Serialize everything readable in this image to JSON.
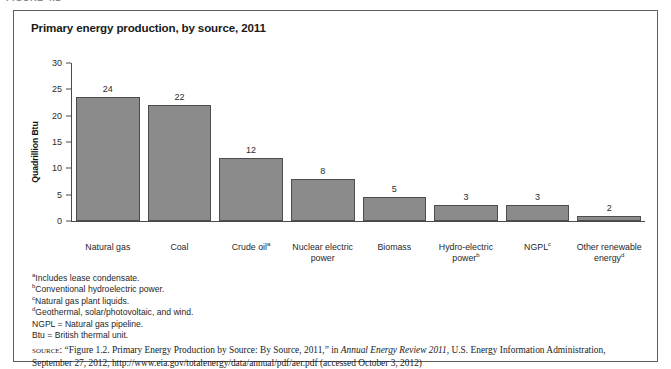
{
  "figure_caption": "FIGURE 4.2",
  "figure": {
    "title": "Primary energy production, by source, 2011"
  },
  "chart_data": {
    "type": "bar",
    "title": "Primary energy production, by source, 2011",
    "xlabel": "",
    "ylabel": "Quadrillion Btu",
    "ylim": [
      0,
      30
    ],
    "yticks": [
      0,
      5,
      10,
      15,
      20,
      25,
      30
    ],
    "grid": false,
    "legend": null,
    "categories": [
      "Natural gas",
      "Coal",
      "Crude oilᵃ",
      "Nuclear electric power",
      "Biomass",
      "Hydro-electric powerᵇ",
      "NGPLᶜ",
      "Other renewable energyᵈ"
    ],
    "values": [
      24,
      22,
      12,
      8,
      5,
      3,
      3,
      2
    ],
    "bar_color": "#8b8b8b",
    "bar_edge_color": "#4d4d4d",
    "data_labels": [
      "24",
      "22",
      "12",
      "8",
      "5",
      "3",
      "3",
      "2"
    ],
    "bar_pixel_heights": [
      23.5,
      22,
      12,
      8,
      4.5,
      3,
      3,
      0.9
    ]
  },
  "x_labels": [
    {
      "line1": "Natural gas",
      "line2": "",
      "sup": ""
    },
    {
      "line1": "Coal",
      "line2": "",
      "sup": ""
    },
    {
      "line1": "Crude oil",
      "line2": "",
      "sup": "a"
    },
    {
      "line1": "Nuclear electric",
      "line2": "power",
      "sup": ""
    },
    {
      "line1": "Biomass",
      "line2": "",
      "sup": ""
    },
    {
      "line1": "Hydro-electric",
      "line2": "power",
      "sup": "b"
    },
    {
      "line1": "NGPL",
      "line2": "",
      "sup": "c"
    },
    {
      "line1": "Other renewable",
      "line2": "energy",
      "sup": "d"
    }
  ],
  "y_tick_labels": [
    "30",
    "25",
    "20",
    "15",
    "10",
    "5",
    "0"
  ],
  "footnotes": [
    {
      "marker": "a",
      "text": "Includes lease condensate."
    },
    {
      "marker": "b",
      "text": "Conventional hydroelectric power."
    },
    {
      "marker": "c",
      "text": "Natural gas plant liquids."
    },
    {
      "marker": "d",
      "text": "Geothermal, solar/photovoltaic, and wind."
    },
    {
      "marker": "",
      "text": "NGPL = Natural gas pipeline."
    },
    {
      "marker": "",
      "text": "Btu = British thermal unit."
    }
  ],
  "source": {
    "label": "source:",
    "part1": " “Figure 1.2. Primary Energy Production by Source: By Source, 2011,” in ",
    "italic": "Annual Energy Review 2011",
    "part2": ", U.S. Energy Information Administration, September 27, 2012, http://www.eia.gov/totalenergy/data/annual/pdf/aer.pdf (accessed October 3, 2012)"
  }
}
